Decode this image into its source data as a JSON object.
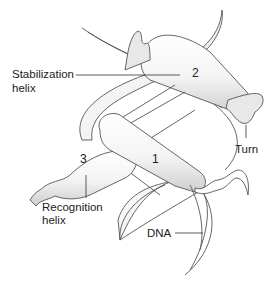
{
  "diagram": {
    "type": "helix-turn-helix protein bound to DNA",
    "labels": {
      "stabilization": "Stabilization",
      "stabilization_line2": "helix",
      "recognition": "Recognition",
      "recognition_line2": "helix",
      "turn": "Turn",
      "dna": "DNA"
    },
    "helix_numbers": {
      "h1": "1",
      "h2": "2",
      "h3": "3"
    },
    "colors": {
      "outline": "#555555",
      "fill_light": "#ffffff",
      "fill_shade": "#d9d9d9",
      "text": "#222222"
    }
  }
}
